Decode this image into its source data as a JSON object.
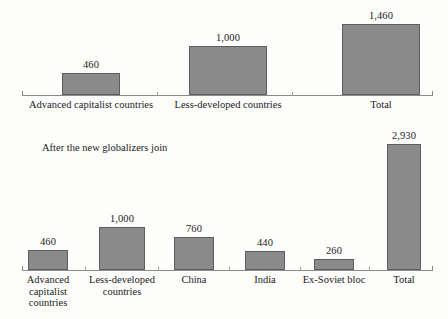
{
  "figure": {
    "background_color": "#fdfdfb",
    "bar_fill_color": "#8a8a8a",
    "bar_border_color": "#5e5e5e",
    "axis_color": "#8a8a86",
    "text_color": "#1c1c1c"
  },
  "panels": [
    {
      "id": "before",
      "caption": "",
      "axis": {
        "x_start_px": 22,
        "x_end_px": 432,
        "baseline_y_px": 95
      },
      "categories": [
        {
          "label_lines": [
            "Advanced capitalist countries"
          ],
          "value": 460,
          "value_label": "460"
        },
        {
          "label_lines": [
            "Less-developed countries"
          ],
          "value": 1000,
          "value_label": "1,000"
        },
        {
          "label_lines": [
            "Total"
          ],
          "value": 1460,
          "value_label": "1,460"
        }
      ]
    },
    {
      "id": "after",
      "caption": "After the new globalizers join",
      "axis": {
        "x_start_px": 22,
        "x_end_px": 432,
        "baseline_y_px": 270
      },
      "categories": [
        {
          "label_lines": [
            "Advanced",
            "capitalist",
            "countries"
          ],
          "value": 460,
          "value_label": "460"
        },
        {
          "label_lines": [
            "Less-developed",
            "countries"
          ],
          "value": 1000,
          "value_label": "1,000"
        },
        {
          "label_lines": [
            "China"
          ],
          "value": 760,
          "value_label": "760"
        },
        {
          "label_lines": [
            "India"
          ],
          "value": 440,
          "value_label": "440"
        },
        {
          "label_lines": [
            "Ex-Soviet bloc"
          ],
          "value": 260,
          "value_label": "260"
        },
        {
          "label_lines": [
            "Total"
          ],
          "value": 2930,
          "value_label": "2,930"
        }
      ]
    }
  ],
  "chart_data": [
    {
      "type": "bar",
      "title": "",
      "subtitle": "",
      "xlabel": "",
      "ylabel": "",
      "categories": [
        "Advanced capitalist countries",
        "Less-developed countries",
        "Total"
      ],
      "values": [
        460,
        1000,
        1460
      ],
      "value_labels": [
        "460",
        "1,000",
        "1,460"
      ],
      "ylim": [
        0,
        2930
      ],
      "grid": false,
      "legend": "none",
      "axis": "single horizontal baseline with end caps and inter-category ticks; no y-axis"
    },
    {
      "type": "bar",
      "title": "After the new globalizers join",
      "subtitle": "",
      "xlabel": "",
      "ylabel": "",
      "categories": [
        "Advanced capitalist countries",
        "Less-developed countries",
        "China",
        "India",
        "Ex-Soviet bloc",
        "Total"
      ],
      "values": [
        460,
        1000,
        760,
        440,
        260,
        2930
      ],
      "value_labels": [
        "460",
        "1,000",
        "760",
        "440",
        "260",
        "2,930"
      ],
      "ylim": [
        0,
        2930
      ],
      "grid": false,
      "legend": "none",
      "axis": "single horizontal baseline with end caps and inter-category ticks; no y-axis"
    }
  ]
}
